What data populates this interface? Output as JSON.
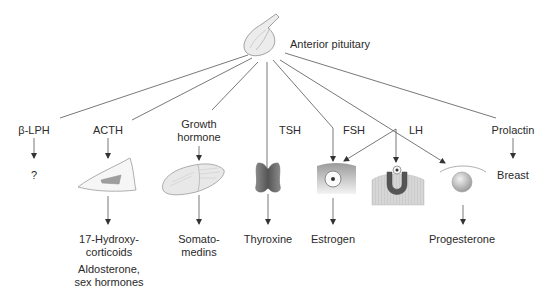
{
  "diagram": {
    "source": {
      "label": "Anterior pituitary",
      "icon": "pituitary-gland-icon"
    },
    "hormones": [
      {
        "id": "b-lph",
        "label": "β-LPH",
        "target_icon": null,
        "target_text": "?",
        "products": []
      },
      {
        "id": "acth",
        "label": "ACTH",
        "target_icon": "adrenal-cortex-cell-icon",
        "target_text": null,
        "products": [
          "17-Hydroxy-\ncorticoids",
          "Aldosterone,\nsex hormones"
        ]
      },
      {
        "id": "gh",
        "label": "Growth\nhormone",
        "target_icon": "liver-icon",
        "target_text": null,
        "products": [
          "Somato-\nmedins"
        ]
      },
      {
        "id": "tsh",
        "label": "TSH",
        "target_icon": "thyroid-gland-icon",
        "target_text": null,
        "products": [
          "Thyroxine"
        ]
      },
      {
        "id": "fsh",
        "label": "FSH",
        "target_icon": "ovarian-follicle-icon",
        "target_text": null,
        "products": [
          "Estrogen"
        ]
      },
      {
        "id": "lh",
        "label": "LH",
        "target_icon": "ovulating-follicle-icon",
        "target_text": null,
        "products": [
          "Progesterone"
        ],
        "note": "LH arrows point to follicle, ovulating follicle and corpus luteum"
      },
      {
        "id": "prolactin",
        "label": "Prolactin",
        "target_icon": null,
        "target_text": "Breast",
        "products": []
      }
    ],
    "extra_targets": [
      {
        "id": "corpus-luteum",
        "icon": "corpus-luteum-icon"
      }
    ]
  },
  "labels": {
    "source": "Anterior pituitary",
    "b_lph": "β-LPH",
    "b_lph_target": "?",
    "acth": "ACTH",
    "acth_prod1": "17-Hydroxy-\ncorticoids",
    "acth_prod2": "Aldosterone,\nsex hormones",
    "gh": "Growth\nhormone",
    "gh_prod": "Somato-\nmedins",
    "tsh": "TSH",
    "tsh_prod": "Thyroxine",
    "fsh": "FSH",
    "fsh_prod": "Estrogen",
    "lh": "LH",
    "lh_prod": "Progesterone",
    "prolactin": "Prolactin",
    "prolactin_target": "Breast"
  },
  "colors": {
    "line": "#555555",
    "text": "#2a2a2a",
    "tissue_light": "#e6e6e6",
    "tissue_mid": "#bdbdbd",
    "tissue_dark": "#6e6e6e"
  }
}
